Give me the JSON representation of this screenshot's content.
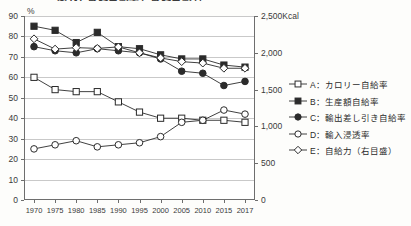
{
  "chart_data": {
    "type": "line",
    "title": "図1-1 食料自給率と食料自給力",
    "xlabel": "",
    "ylabel": "%",
    "y2label": "Kcal",
    "grid": true,
    "legend_position": "right",
    "x": [
      "1970",
      "1975",
      "1980",
      "1985",
      "1990",
      "1995",
      "2000",
      "2005",
      "2010",
      "2015",
      "2017"
    ],
    "categories": [
      "1970",
      "1975",
      "1980",
      "1985",
      "1990",
      "1995",
      "2000",
      "2005",
      "2010",
      "2015",
      "2017"
    ],
    "ylim": [
      0,
      90
    ],
    "yticks": [
      "0",
      "10",
      "20",
      "30",
      "40",
      "50",
      "60",
      "70",
      "80",
      "90"
    ],
    "y2lim": [
      0,
      2500
    ],
    "y2ticks": [
      "0",
      "500",
      "1,000",
      "1,500",
      "2,000",
      "2,500"
    ],
    "y2_top_label": "2,500Kcal",
    "series": [
      {
        "key": "A",
        "name": "A：カロリー自給率",
        "marker": "open-square",
        "axis": "left",
        "values": [
          60,
          54,
          53,
          53,
          48,
          43,
          40,
          40,
          39,
          39,
          38
        ]
      },
      {
        "key": "B",
        "name": "B：生産額自給率",
        "marker": "filled-square",
        "axis": "left",
        "values": [
          85,
          83,
          77,
          82,
          75,
          74,
          71,
          69,
          69,
          66,
          65
        ]
      },
      {
        "key": "C",
        "name": "C：輸出差し引き自給率",
        "marker": "filled-circle",
        "axis": "left",
        "values": [
          75,
          73,
          72,
          74,
          73,
          72,
          69,
          63,
          62,
          56,
          58
        ]
      },
      {
        "key": "D",
        "name": "D：輸入浸透率",
        "marker": "open-circle",
        "axis": "left",
        "values": [
          25,
          27,
          29,
          26,
          27,
          28,
          31,
          38,
          39,
          44,
          42
        ]
      },
      {
        "key": "E",
        "name": "E：自給力（右目盛）",
        "marker": "open-diamond",
        "axis": "right",
        "values": [
          2190,
          2050,
          2070,
          2060,
          2080,
          2000,
          1930,
          1880,
          1860,
          1790,
          1790
        ]
      }
    ]
  },
  "legend": {
    "items": [
      {
        "label": "A：カロリー自給率",
        "marker": "open-square"
      },
      {
        "label": "B：生産額自給率",
        "marker": "filled-square"
      },
      {
        "label": "C：輸出差し引き自給率",
        "marker": "filled-circle"
      },
      {
        "label": "D：輸入浸透率",
        "marker": "open-circle"
      },
      {
        "label": "E：自給力（右目盛）",
        "marker": "open-diamond"
      }
    ]
  },
  "colors": {
    "ink": "#2b2b2b",
    "grid": "#c9c9c9",
    "axis": "#6e6e6e",
    "plot_bg": "#ffffff",
    "page_bg": "#fdfdfb"
  }
}
